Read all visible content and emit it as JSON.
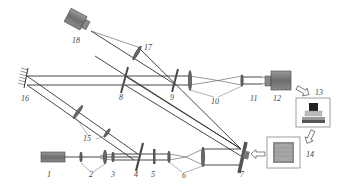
{
  "diagram": {
    "type": "optical-setup-schematic",
    "labels": {
      "l1": "1",
      "l2": "2",
      "l3": "3",
      "l4": "4",
      "l5": "5",
      "l6": "6",
      "l7": "7",
      "l8": "8",
      "l9": "9",
      "l10": "10",
      "l11": "11",
      "l12": "12",
      "l13": "13",
      "l14": "14",
      "l15": "15",
      "l16": "16",
      "l17": "17",
      "l18": "18"
    },
    "components": [
      {
        "id": "1",
        "kind": "laser"
      },
      {
        "id": "2",
        "kind": "lens-pair"
      },
      {
        "id": "3",
        "kind": "lens"
      },
      {
        "id": "4",
        "kind": "beam-splitter"
      },
      {
        "id": "5",
        "kind": "optical-element"
      },
      {
        "id": "6",
        "kind": "lens-pair"
      },
      {
        "id": "7",
        "kind": "spatial-light-modulator"
      },
      {
        "id": "8",
        "kind": "beam-splitter"
      },
      {
        "id": "9",
        "kind": "beam-splitter"
      },
      {
        "id": "10",
        "kind": "lens-pair"
      },
      {
        "id": "11",
        "kind": "lens"
      },
      {
        "id": "12",
        "kind": "camera"
      },
      {
        "id": "13",
        "kind": "computer"
      },
      {
        "id": "14",
        "kind": "display"
      },
      {
        "id": "15",
        "kind": "lens-pair"
      },
      {
        "id": "16",
        "kind": "mirror"
      },
      {
        "id": "17",
        "kind": "lens"
      },
      {
        "id": "18",
        "kind": "camera"
      }
    ],
    "colors": {
      "line": "#333333",
      "device_fill": "#7a7a7a",
      "background": "#ffffff"
    }
  }
}
